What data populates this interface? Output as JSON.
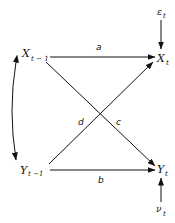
{
  "diagram": {
    "type": "path-diagram",
    "nodes": {
      "x_prev": {
        "base": "X",
        "sub": "t − 1"
      },
      "x_curr": {
        "base": "X",
        "sub": "t"
      },
      "y_prev": {
        "base": "Y",
        "sub": "t −1"
      },
      "y_curr": {
        "base": "Y",
        "sub": "t"
      },
      "eps": {
        "base": "ε",
        "sub": "t"
      },
      "nu": {
        "base": "ν",
        "sub": "t"
      }
    },
    "edges": {
      "a": {
        "label": "a",
        "from": "X t-1",
        "to": "X t"
      },
      "b": {
        "label": "b",
        "from": "Y t-1",
        "to": "Y t"
      },
      "c": {
        "label": "c",
        "from": "X t-1",
        "to": "Y t"
      },
      "d": {
        "label": "d",
        "from": "Y t-1",
        "to": "X t"
      }
    },
    "correlation": {
      "between": [
        "X t-1",
        "Y t-1"
      ],
      "style": "double-headed curved arrow"
    },
    "colors": {
      "ink": "#111111",
      "background": "#ffffff"
    }
  }
}
